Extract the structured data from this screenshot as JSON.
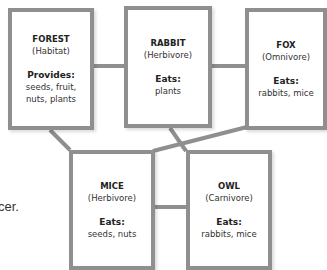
{
  "diagram": {
    "type": "food-web",
    "connector_color": "#8f8f8f",
    "box_border_color": "#8f8f8f",
    "nodes": [
      {
        "id": "forest",
        "name": "FOREST",
        "role": "(Habitat)",
        "label": "Provides:",
        "items": [
          "seeds, fruit,",
          "nuts, plants"
        ]
      },
      {
        "id": "rabbit",
        "name": "RABBIT",
        "role": "(Herbivore)",
        "label": "Eats:",
        "items": [
          "plants"
        ]
      },
      {
        "id": "fox",
        "name": "FOX",
        "role": "(Omnivore)",
        "label": "Eats:",
        "items": [
          "rabbits, mice"
        ]
      },
      {
        "id": "mice",
        "name": "MICE",
        "role": "(Herbivore)",
        "label": "Eats:",
        "items": [
          "seeds, nuts"
        ]
      },
      {
        "id": "owl",
        "name": "OWL",
        "role": "(Carnivore)",
        "label": "Eats:",
        "items": [
          "rabbits, mice"
        ]
      }
    ],
    "edges": [
      {
        "from": "forest",
        "to": "rabbit"
      },
      {
        "from": "rabbit",
        "to": "fox"
      },
      {
        "from": "forest",
        "to": "mice"
      },
      {
        "from": "rabbit",
        "to": "owl"
      },
      {
        "from": "fox",
        "to": "mice"
      },
      {
        "from": "mice",
        "to": "owl"
      }
    ]
  },
  "side_text": "cer."
}
